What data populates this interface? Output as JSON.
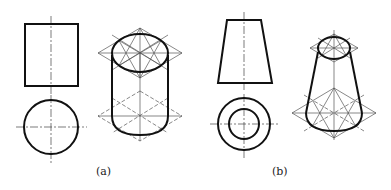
{
  "figures": [
    {
      "id": "a",
      "label": "(a)",
      "description": "Cylinder: front view (rectangle), top view (circle), and isometric drawing with rhombus construction",
      "front_view": "rectangle",
      "top_view": "circle",
      "isometric": "cylinder"
    },
    {
      "id": "b",
      "label": "(b)",
      "description": "Frustum of cone: front view (trapezoid), top view (concentric circles), and isometric drawing with rhombus construction",
      "front_view": "trapezoid",
      "top_view": "concentric-circles",
      "isometric": "truncated-cone"
    }
  ],
  "colors": {
    "outline": "#111111",
    "construction": "#555555",
    "centerline": "#444444"
  }
}
